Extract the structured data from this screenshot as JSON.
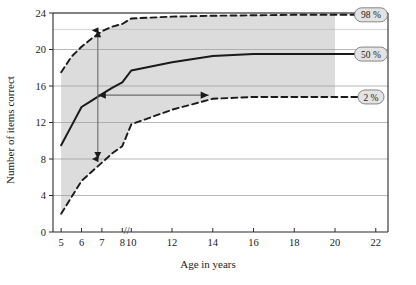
{
  "chart_data": {
    "type": "line",
    "title": "",
    "xlabel": "Age in years",
    "ylabel": "Number of items correct",
    "xlim": [
      4.6,
      22.6
    ],
    "ylim": [
      0,
      24
    ],
    "x_ticks": [
      "5",
      "6",
      "7",
      "8",
      "10",
      "12",
      "14",
      "16",
      "18",
      "20",
      "22"
    ],
    "x_tick_values": [
      5,
      6,
      7,
      8,
      10,
      12,
      14,
      16,
      18,
      20,
      22
    ],
    "y_ticks": [
      "0",
      "4",
      "8",
      "12",
      "16",
      "20",
      "24"
    ],
    "y_tick_values": [
      0,
      4,
      8,
      12,
      16,
      20,
      24
    ],
    "axis_break": {
      "label": "//",
      "between": [
        8,
        10
      ],
      "at_value": 9.0
    },
    "grid": "horizontal",
    "legend_position": "right-inline",
    "shaded_band": {
      "from_x": 5,
      "to_x": 20,
      "color": "#dcdcdc",
      "between_series": [
        "2 %",
        "98 %"
      ]
    },
    "series": [
      {
        "name": "98 %",
        "label": "98 %",
        "style": "dashed",
        "color": "#1a1a1a",
        "x": [
          5,
          5.5,
          6,
          6.5,
          7,
          7.5,
          8,
          10,
          12,
          14,
          16,
          18,
          20,
          22
        ],
        "values": [
          17.5,
          19.2,
          20.3,
          21.2,
          22.0,
          22.5,
          22.8,
          23.4,
          23.6,
          23.7,
          23.75,
          23.8,
          23.8,
          23.8
        ]
      },
      {
        "name": "50 %",
        "label": "50 %",
        "style": "solid",
        "color": "#1a1a1a",
        "x": [
          5,
          5.5,
          6,
          6.5,
          7,
          7.5,
          8,
          10,
          12,
          14,
          16,
          18,
          20,
          22
        ],
        "values": [
          9.5,
          11.6,
          13.7,
          14.4,
          15.1,
          15.8,
          16.4,
          17.7,
          18.6,
          19.3,
          19.5,
          19.5,
          19.5,
          19.5
        ]
      },
      {
        "name": "2 %",
        "label": "2 %",
        "style": "dashed",
        "color": "#1a1a1a",
        "x": [
          5,
          5.5,
          6,
          6.5,
          7,
          7.5,
          8,
          10,
          12,
          14,
          16,
          18,
          20,
          22
        ],
        "values": [
          2.0,
          3.8,
          5.6,
          6.6,
          7.6,
          8.6,
          9.4,
          11.8,
          13.4,
          14.6,
          14.8,
          14.8,
          14.8,
          14.8
        ]
      }
    ],
    "annotations": [
      {
        "name": "vertical-range-arrow",
        "type": "double-arrow",
        "orientation": "vertical",
        "x": 6.8,
        "y_from": 8.0,
        "y_to": 22.1
      },
      {
        "name": "horizontal-age-arrow",
        "type": "single-arrow",
        "orientation": "horizontal",
        "y": 15.0,
        "x_from": 6.8,
        "x_to": 13.8
      }
    ],
    "pill_labels": [
      {
        "text": "98 %",
        "y_value": 23.8
      },
      {
        "text": "50 %",
        "y_value": 19.5
      },
      {
        "text": "2 %",
        "y_value": 14.8
      }
    ]
  }
}
